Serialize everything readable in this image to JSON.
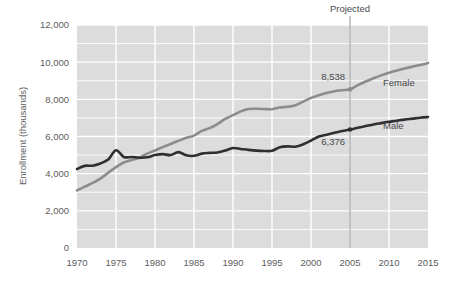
{
  "chart_data": {
    "type": "line",
    "title": "",
    "xlabel": "",
    "ylabel": "Enrollment (thousands)",
    "xlim": [
      1970,
      2015
    ],
    "ylim": [
      0,
      12000
    ],
    "grid": true,
    "legend_position": "inline-right",
    "x_ticks": [
      "1970",
      "1975",
      "1980",
      "1985",
      "1990",
      "1995",
      "2000",
      "2005",
      "2010",
      "2015"
    ],
    "y_ticks": [
      "0",
      "2,000",
      "4,000",
      "6,000",
      "8,000",
      "10,000",
      "12,000"
    ],
    "x": [
      1970,
      1971,
      1972,
      1973,
      1974,
      1975,
      1976,
      1977,
      1978,
      1979,
      1980,
      1981,
      1982,
      1983,
      1984,
      1985,
      1986,
      1987,
      1988,
      1989,
      1990,
      1991,
      1992,
      1993,
      1994,
      1995,
      1996,
      1997,
      1998,
      1999,
      2000,
      2001,
      2002,
      2003,
      2004,
      2005,
      2006,
      2007,
      2008,
      2009,
      2010,
      2011,
      2012,
      2013,
      2014,
      2015
    ],
    "series": [
      {
        "name": "Male",
        "color": "#2f2f31",
        "values": [
          4250,
          4420,
          4430,
          4550,
          4760,
          5260,
          4900,
          4900,
          4860,
          4880,
          5000,
          5050,
          5000,
          5160,
          4990,
          4960,
          5080,
          5120,
          5140,
          5240,
          5380,
          5330,
          5280,
          5240,
          5220,
          5230,
          5420,
          5470,
          5450,
          5580,
          5780,
          6000,
          6100,
          6200,
          6300,
          6376,
          6470,
          6560,
          6650,
          6720,
          6790,
          6850,
          6910,
          6960,
          7010,
          7050
        ]
      },
      {
        "name": "Female",
        "color": "#8c8c8e",
        "values": [
          3100,
          3300,
          3500,
          3730,
          4050,
          4350,
          4600,
          4730,
          4860,
          5080,
          5250,
          5430,
          5600,
          5770,
          5930,
          6050,
          6300,
          6450,
          6670,
          6950,
          7150,
          7350,
          7480,
          7490,
          7480,
          7470,
          7560,
          7600,
          7680,
          7880,
          8080,
          8220,
          8340,
          8440,
          8490,
          8538,
          8760,
          8960,
          9130,
          9290,
          9430,
          9550,
          9660,
          9760,
          9850,
          9950
        ]
      }
    ],
    "annotations": [
      {
        "name": "projected-divider",
        "label": "Projected",
        "x": 2005
      },
      {
        "name": "female-value-label",
        "label": "8,538",
        "x": 2005,
        "y": 8538
      },
      {
        "name": "male-value-label",
        "label": "6,376",
        "x": 2005,
        "y": 6376
      }
    ],
    "colors": {
      "plot_background": "#dcdcdc",
      "gridline": "#ffffff",
      "male_line": "#2f2f31",
      "female_line": "#8c8c8e",
      "projected_line": "#8f8f92",
      "text": "#5d5d60"
    }
  }
}
